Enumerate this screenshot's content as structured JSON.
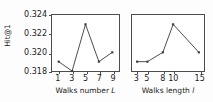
{
  "chart_data": [
    {
      "type": "line",
      "panel": "left",
      "title": "",
      "xlabel": "Walks number L",
      "xlabel_symbol": "L",
      "xlabel_prefix": "Walks number ",
      "ylabel": "Hit@1",
      "x": [
        1,
        3,
        5,
        7,
        9
      ],
      "xticks": [
        "1",
        "3",
        "5",
        "7",
        "9"
      ],
      "values": [
        0.319,
        0.318,
        0.323,
        0.319,
        0.32
      ],
      "xlim": [
        0,
        10
      ],
      "ylim": [
        0.318,
        0.324
      ],
      "yticks": [
        "0.318",
        "0.320",
        "0.322",
        "0.324"
      ],
      "ytickvalues": [
        0.318,
        0.32,
        0.322,
        0.324
      ],
      "grid": false,
      "legend": "none",
      "marker": "square",
      "line_color": "#3a3a3a"
    },
    {
      "type": "line",
      "panel": "right",
      "title": "",
      "xlabel": "Walks length l",
      "xlabel_symbol": "l",
      "xlabel_prefix": "Walks length ",
      "ylabel": "",
      "x": [
        3,
        5,
        8,
        10,
        15
      ],
      "xticks": [
        "3",
        "5",
        "8",
        "10",
        "15"
      ],
      "values": [
        0.319,
        0.319,
        0.32,
        0.323,
        0.32
      ],
      "xlim": [
        2,
        16
      ],
      "ylim": [
        0.318,
        0.324
      ],
      "yticks": [],
      "grid": false,
      "legend": "none",
      "marker": "square",
      "line_color": "#3a3a3a"
    }
  ],
  "axes": {
    "ylabel": "Hit@1",
    "ytick_labels": [
      "0.324",
      "0.322",
      "0.320",
      "0.318"
    ]
  }
}
